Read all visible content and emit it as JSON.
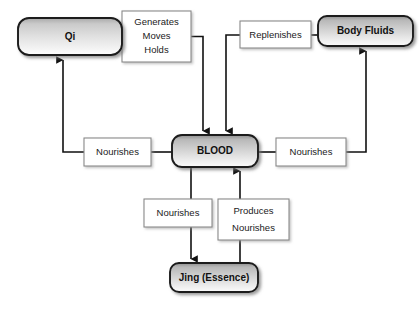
{
  "diagram": {
    "type": "flow-diagram",
    "background_color": "#ffffff",
    "node_border_color": "#1a1a1a",
    "label_border_color": "#8a8a8a",
    "line_color": "#1a1a1a",
    "nodes": [
      {
        "id": "qi",
        "label": "Qi",
        "shape": "rounded-rect",
        "fill": "gradient-gray",
        "x": 18,
        "y": 18,
        "w": 104,
        "h": 37
      },
      {
        "id": "body_fluids",
        "label": "Body Fluids",
        "shape": "rounded-rect",
        "fill": "gradient-gray",
        "x": 318,
        "y": 16,
        "w": 95,
        "h": 30
      },
      {
        "id": "blood",
        "label": "BLOOD",
        "shape": "rounded-rect",
        "fill": "gradient-gray",
        "x": 172,
        "y": 135,
        "w": 86,
        "h": 32
      },
      {
        "id": "jing",
        "label": "Jing (Essence)",
        "shape": "rounded-rect",
        "fill": "gradient-gray",
        "x": 170,
        "y": 263,
        "w": 88,
        "h": 29
      }
    ],
    "edge_labels": [
      {
        "id": "generates_moves_holds",
        "lines": [
          "Generates",
          "Moves",
          "Holds"
        ],
        "x": 122,
        "y": 11,
        "w": 69,
        "h": 51
      },
      {
        "id": "replenishes",
        "lines": [
          "Replenishes"
        ],
        "x": 240,
        "y": 21,
        "w": 71,
        "h": 27
      },
      {
        "id": "nourishes_left",
        "lines": [
          "Nourishes"
        ],
        "x": 84,
        "y": 138,
        "w": 67,
        "h": 28
      },
      {
        "id": "nourishes_right",
        "lines": [
          "Nourishes"
        ],
        "x": 276,
        "y": 138,
        "w": 70,
        "h": 28
      },
      {
        "id": "nourishes_bottom",
        "lines": [
          "Nourishes"
        ],
        "x": 144,
        "y": 199,
        "w": 68,
        "h": 28
      },
      {
        "id": "produces_nourishes",
        "lines": [
          "Produces",
          "Nourishes"
        ],
        "x": 218,
        "y": 199,
        "w": 71,
        "h": 41
      }
    ],
    "relationships": [
      {
        "from": "qi",
        "to": "blood",
        "label": "Generates Moves Holds"
      },
      {
        "from": "body_fluids",
        "to": "blood",
        "label": "Replenishes"
      },
      {
        "from": "blood",
        "to": "qi",
        "label": "Nourishes"
      },
      {
        "from": "blood",
        "to": "body_fluids",
        "label": "Nourishes"
      },
      {
        "from": "blood",
        "to": "jing",
        "label": "Nourishes"
      },
      {
        "from": "jing",
        "to": "blood",
        "label": "Produces Nourishes"
      }
    ]
  }
}
